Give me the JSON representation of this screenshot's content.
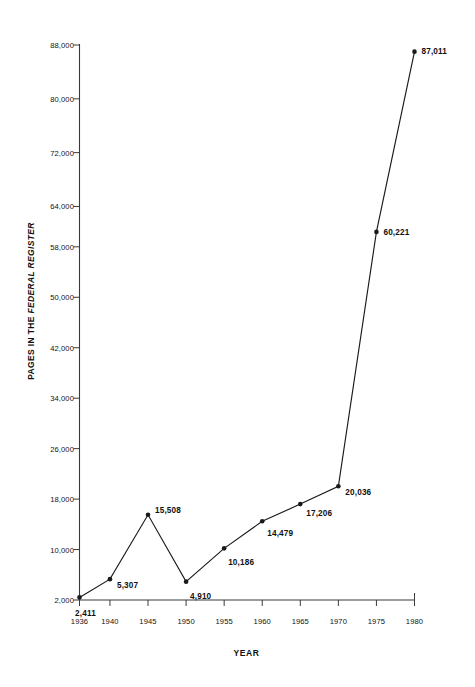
{
  "chart_data": {
    "type": "line",
    "title": "",
    "xlabel": "YEAR",
    "ylabel": "PAGES IN THE FEDERAL REGISTER",
    "ylabel_plain": "PAGES IN THE",
    "ylabel_italic": "FEDERAL REGISTER",
    "x": [
      1936,
      1940,
      1945,
      1950,
      1955,
      1960,
      1965,
      1970,
      1975,
      1980
    ],
    "values": [
      2411,
      5307,
      15508,
      4910,
      10186,
      14479,
      17206,
      20036,
      60221,
      87011
    ],
    "point_labels": [
      "2,411",
      "5,307",
      "15,508",
      "4,910",
      "10,186",
      "14,479",
      "17,206",
      "20,036",
      "60,221",
      "87,011"
    ],
    "xtick_labels": [
      "1936",
      "1940",
      "1945",
      "1950",
      "1955",
      "1960",
      "1965",
      "1970",
      "1975",
      "1980"
    ],
    "ytick_values": [
      2000,
      10000,
      18000,
      26000,
      34000,
      42000,
      50000,
      58000,
      64000,
      72000,
      80000,
      88000
    ],
    "ytick_labels": [
      "2,000",
      "10,000",
      "18,000",
      "26,000",
      "34,000",
      "42,000",
      "50,000",
      "58,000",
      "64,000",
      "72,000",
      "80,000",
      "88,000"
    ],
    "ylim": [
      2000,
      88000
    ],
    "xlim": [
      1936,
      1980
    ],
    "grid": false,
    "legend": "none",
    "line_color": "#1a1a1a",
    "marker_color": "#1a1a1a",
    "axis_color": "#3a3a3a",
    "background": "#ffffff"
  },
  "label_positions": [
    {
      "anchor": "center",
      "dx": 6,
      "dy": 16
    },
    {
      "anchor": "right",
      "dx": 7,
      "dy": 6
    },
    {
      "anchor": "right",
      "dx": 7,
      "dy": -5
    },
    {
      "anchor": "right",
      "dx": 4,
      "dy": 14
    },
    {
      "anchor": "right",
      "dx": 4,
      "dy": 14
    },
    {
      "anchor": "right",
      "dx": 5,
      "dy": 12
    },
    {
      "anchor": "right",
      "dx": 6,
      "dy": 9
    },
    {
      "anchor": "right",
      "dx": 7,
      "dy": 6
    },
    {
      "anchor": "right",
      "dx": 7,
      "dy": 0
    },
    {
      "anchor": "right",
      "dx": 7,
      "dy": -1
    }
  ]
}
